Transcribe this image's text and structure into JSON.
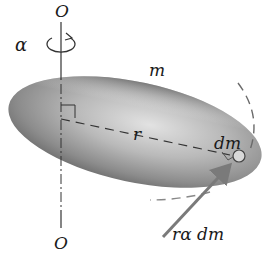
{
  "figure": {
    "labels": {
      "axis_top": "O",
      "axis_bottom": "O",
      "angular_acceleration": "α",
      "mass": "m",
      "radius": "r",
      "mass_element": "dm",
      "tangential_force": "rα dm"
    },
    "colors": {
      "body_fill_dark": "#6e6e6e",
      "body_fill_light": "#d8d8d8",
      "axis_line": "#333333",
      "force_arrow": "#7a7a7a",
      "dashed_path": "#555555",
      "background": "#ffffff"
    },
    "elements": {
      "axis": "vertical dash-dot rotation axis through O-O",
      "rotation_arrow": "circular arrow around axis indicating α",
      "body": "elongated gray ellipsoid of mass m",
      "radius_line": "dashed line from axis to dm, perpendicular to axis (right-angle mark)",
      "element": "small circle marking dm",
      "circular_path": "dashed arc showing circular path of dm",
      "force_arrow": "gray arrow pointing to dm, tangential force rα dm"
    }
  }
}
